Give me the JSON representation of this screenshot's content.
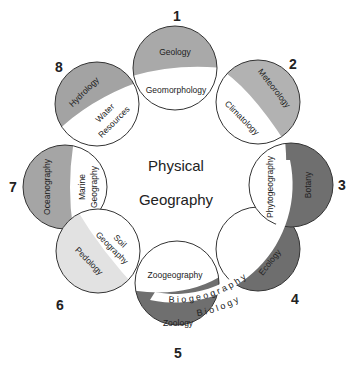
{
  "title": [
    "Physical",
    "Geography"
  ],
  "colors": {
    "light_gray": "#b0b0b0",
    "medium_gray": "#a3a3a3",
    "dark_gray": "#6f6f6f",
    "pale_gray": "#e2e2e2",
    "outline": "#333333",
    "background": "#ffffff"
  },
  "circles": [
    {
      "number": "1",
      "field": "Geology",
      "subfield": "Geomorphology"
    },
    {
      "number": "2",
      "field": "Meteorology",
      "subfield": "Climatology"
    },
    {
      "number": "3",
      "field": "Botany",
      "subfield": "Phytogeography"
    },
    {
      "number": "4",
      "field": "Ecology",
      "subfield": ""
    },
    {
      "number": "5",
      "field": "Zoology",
      "subfield": "Zoogeography"
    },
    {
      "number": "6",
      "field": "Pedology",
      "subfield": "Soil Geography"
    },
    {
      "number": "7",
      "field": "Oceanography",
      "subfield": "Marine Geography"
    },
    {
      "number": "8",
      "field": "Hydrology",
      "subfield": "Water Resources"
    }
  ],
  "subfield_lines": {
    "water": "Water",
    "resources": "Resources",
    "soil": "Soil",
    "geography": "Geography",
    "marine": "Marine"
  },
  "arc_labels": {
    "biogeography": "B i o g e o g r a p h y",
    "biology": "B i o l o g y"
  }
}
